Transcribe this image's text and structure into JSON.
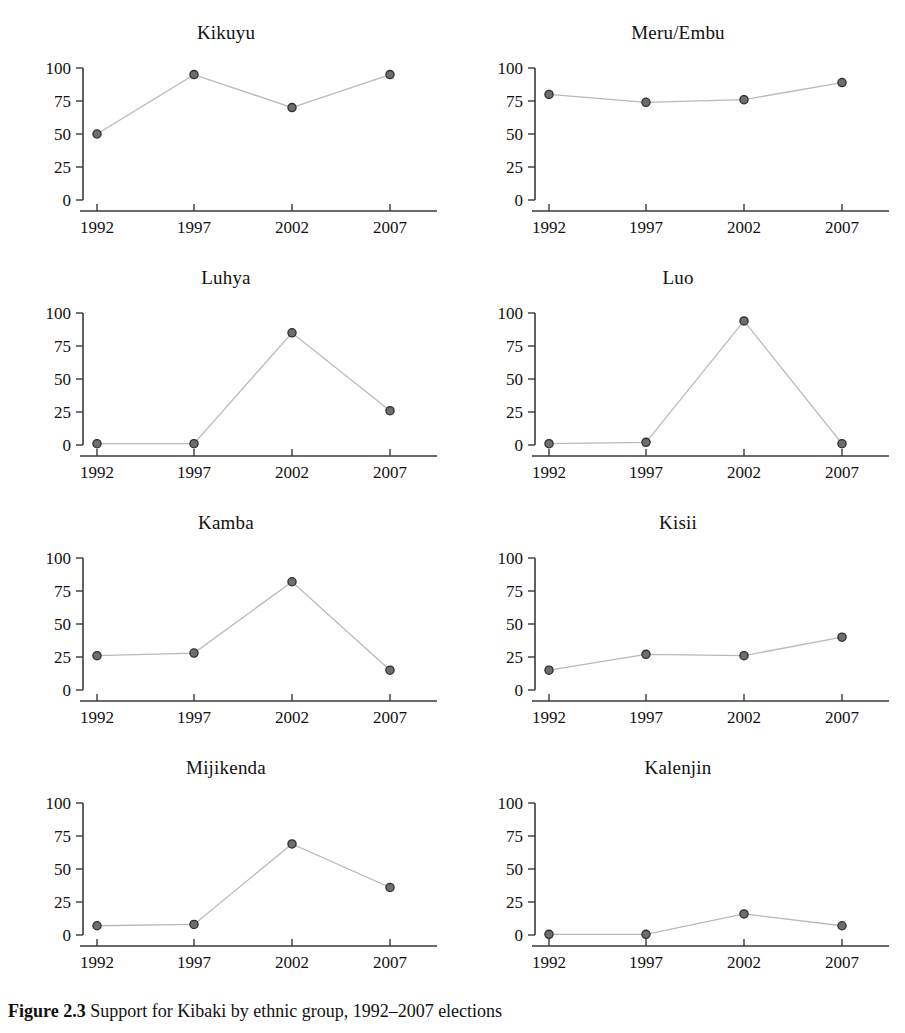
{
  "caption": {
    "label": "Figure 2.3",
    "text": "Support for Kibaki by ethnic group, 1992–2007 elections"
  },
  "chart_data": {
    "type": "line",
    "title": "Support for Kibaki by ethnic group, 1992–2007 elections",
    "xlabel": "",
    "ylabel": "",
    "x": [
      "1992",
      "1997",
      "2002",
      "2007"
    ],
    "categories": [
      "1992",
      "1997",
      "2002",
      "2007"
    ],
    "xtick_labels": [
      "1992",
      "1997",
      "2002",
      "2007"
    ],
    "ytick_labels": [
      "0",
      "25",
      "50",
      "75",
      "100"
    ],
    "yticks": [
      0,
      25,
      50,
      75,
      100
    ],
    "ylim": [
      0,
      100
    ],
    "grid": false,
    "legend": false,
    "layout": "2 columns x 4 rows small multiples",
    "marker": "filled circle",
    "line_color": "#b9b9b9",
    "marker_color": "#6e6e6e",
    "axis_color": "#3a3a3a",
    "panels": [
      {
        "title": "Kikuyu",
        "values": [
          50,
          95,
          70,
          95
        ]
      },
      {
        "title": "Meru/Embu",
        "values": [
          80,
          74,
          76,
          89
        ]
      },
      {
        "title": "Luhya",
        "values": [
          1,
          1,
          85,
          26
        ]
      },
      {
        "title": "Luo",
        "values": [
          1,
          2,
          94,
          1
        ]
      },
      {
        "title": "Kamba",
        "values": [
          26,
          28,
          82,
          15
        ]
      },
      {
        "title": "Kisii",
        "values": [
          15,
          27,
          26,
          40
        ]
      },
      {
        "title": "Mijikenda",
        "values": [
          7,
          8,
          69,
          36
        ]
      },
      {
        "title": "Kalenjin",
        "values": [
          0.5,
          0.5,
          16,
          7
        ]
      }
    ]
  }
}
